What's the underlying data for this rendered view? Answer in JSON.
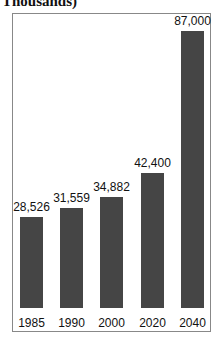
{
  "chart_data": {
    "type": "bar",
    "title": "Thousands)",
    "xlabel": "",
    "ylabel": "",
    "categories": [
      "1985",
      "1990",
      "2000",
      "2020",
      "2040"
    ],
    "values": [
      28526,
      31559,
      34882,
      42400,
      87000
    ],
    "value_labels": [
      "28,526",
      "31,559",
      "34,882",
      "42,400",
      "87,000"
    ],
    "ylim": [
      0,
      100000
    ],
    "grid": false,
    "legend": null,
    "bar_color": "#454545"
  }
}
